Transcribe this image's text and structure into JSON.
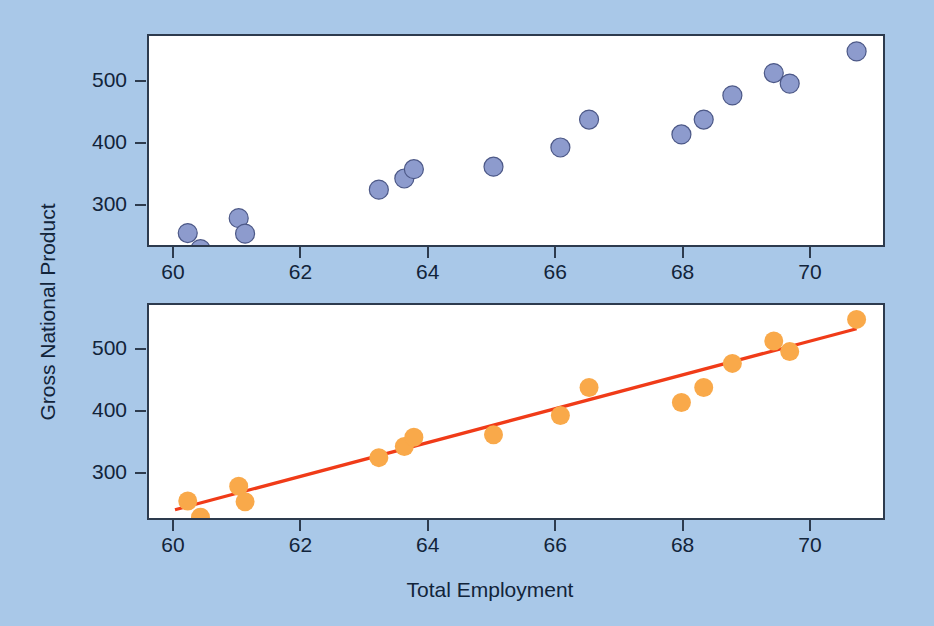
{
  "figure": {
    "background_color": "#a9c8e8",
    "panel_background": "#ffffff",
    "axis_color": "#2d3b4e"
  },
  "axes": {
    "xlabel": "Total Employment",
    "ylabel": "Gross National Product",
    "x_ticks": [
      "60",
      "62",
      "64",
      "66",
      "68",
      "70"
    ],
    "y_ticks": [
      "500",
      "400",
      "300"
    ]
  },
  "chart_data": [
    {
      "type": "scatter",
      "panel": "top",
      "title": "",
      "xlabel": "",
      "ylabel": "",
      "xlim": [
        59.6,
        71.1
      ],
      "ylim": [
        215,
        572
      ],
      "grid": false,
      "legend": "none",
      "marker_color": "#8d9bcd",
      "marker_edge_color": "#4c5887",
      "x_tick_values": [
        60,
        62,
        64,
        66,
        68,
        70
      ],
      "y_tick_values": [
        300,
        400,
        500
      ],
      "x": [
        60.2,
        60.4,
        61.0,
        61.1,
        63.2,
        63.6,
        63.75,
        65.0,
        66.05,
        66.5,
        67.95,
        68.3,
        68.75,
        69.4,
        69.65,
        70.7
      ],
      "y": [
        258,
        232,
        282,
        257,
        328,
        346,
        361,
        365,
        396,
        441,
        417,
        441,
        480,
        516,
        499,
        551
      ]
    },
    {
      "type": "scatter",
      "panel": "bottom",
      "title": "",
      "xlabel": "Total Employment",
      "ylabel": "Gross National Product",
      "xlim": [
        59.6,
        71.1
      ],
      "ylim": [
        215,
        572
      ],
      "grid": false,
      "legend": "none",
      "marker_color": "#f9a94a",
      "x_tick_values": [
        60,
        62,
        64,
        66,
        68,
        70
      ],
      "y_tick_values": [
        300,
        400,
        500
      ],
      "x": [
        60.2,
        60.4,
        61.0,
        61.1,
        63.2,
        63.6,
        63.75,
        65.0,
        66.05,
        66.5,
        67.95,
        68.3,
        68.75,
        69.4,
        69.65,
        70.7
      ],
      "y": [
        258,
        232,
        282,
        257,
        328,
        346,
        361,
        365,
        396,
        441,
        417,
        441,
        480,
        516,
        499,
        551
      ],
      "fit_line": {
        "color": "#f03b18",
        "x_start": 60.0,
        "y_start": 244,
        "x_end": 70.7,
        "y_end": 536
      }
    }
  ]
}
